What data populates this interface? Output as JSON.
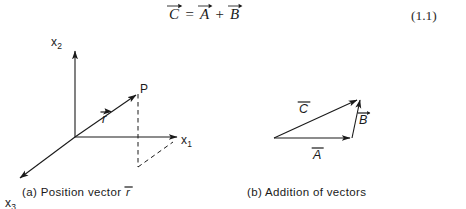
{
  "equation": {
    "lhs": "C",
    "relation": "=",
    "operand1": "A",
    "operator": "+",
    "operand2": "B",
    "number": "(1.1)",
    "plain_text": "C⃗ = A⃗ + B⃗"
  },
  "figure_a": {
    "id": "a",
    "caption_prefix": "(a)",
    "caption_text": "Position vector",
    "caption_vector": "r",
    "axes": [
      {
        "name": "x2",
        "label_base": "x",
        "label_sub": "2",
        "description": "vertical axis"
      },
      {
        "name": "x1",
        "label_base": "x",
        "label_sub": "1",
        "description": "horizontal axis to the right"
      },
      {
        "name": "x3",
        "label_base": "x",
        "label_sub": "3",
        "description": "diagonal axis toward lower left"
      }
    ],
    "point_label": "P",
    "vector_label": "r"
  },
  "figure_b": {
    "id": "b",
    "caption_prefix": "(b)",
    "caption_text": "Addition of vectors",
    "vectors": [
      {
        "name": "C",
        "label": "C",
        "description": "resultant, from tail of A to head of B"
      },
      {
        "name": "B",
        "label": "B",
        "description": "second addend, head of A upward"
      },
      {
        "name": "A",
        "label": "A",
        "description": "first addend, horizontal base"
      }
    ]
  },
  "colors": {
    "ink": "#1a1a1a",
    "paper": "#ffffff",
    "rule": "#2a2a2a"
  }
}
